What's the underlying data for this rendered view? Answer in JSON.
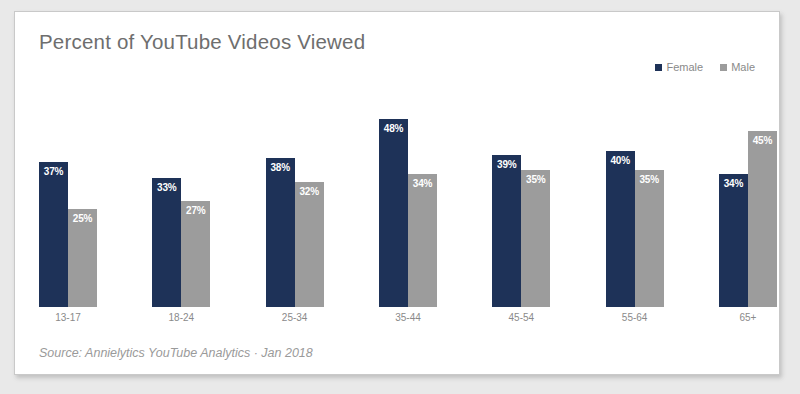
{
  "card": {
    "title": "Percent of YouTube Videos Viewed",
    "source": "Source: Annielytics YouTube Analytics · Jan 2018"
  },
  "legend": {
    "items": [
      {
        "label": "Female",
        "color": "#1e3258"
      },
      {
        "label": "Male",
        "color": "#9c9c9c"
      }
    ]
  },
  "chart_data": {
    "type": "bar",
    "title": "Percent of YouTube Videos Viewed",
    "xlabel": "",
    "ylabel": "",
    "ylim": [
      0,
      55
    ],
    "grid": false,
    "legend_position": "top-right",
    "categories": [
      "13-17",
      "18-24",
      "25-34",
      "35-44",
      "45-54",
      "55-64",
      "65+"
    ],
    "series": [
      {
        "name": "Female",
        "color": "#1e3258",
        "values": [
          37,
          33,
          38,
          48,
          39,
          40,
          34
        ],
        "labels": [
          "37%",
          "33%",
          "38%",
          "48%",
          "39%",
          "40%",
          "34%"
        ]
      },
      {
        "name": "Male",
        "color": "#9c9c9c",
        "values": [
          25,
          27,
          32,
          34,
          35,
          35,
          45
        ],
        "labels": [
          "25%",
          "27%",
          "32%",
          "34%",
          "35%",
          "35%",
          "45%"
        ]
      }
    ],
    "annotations": [
      "Source: Annielytics YouTube Analytics · Jan 2018"
    ]
  }
}
